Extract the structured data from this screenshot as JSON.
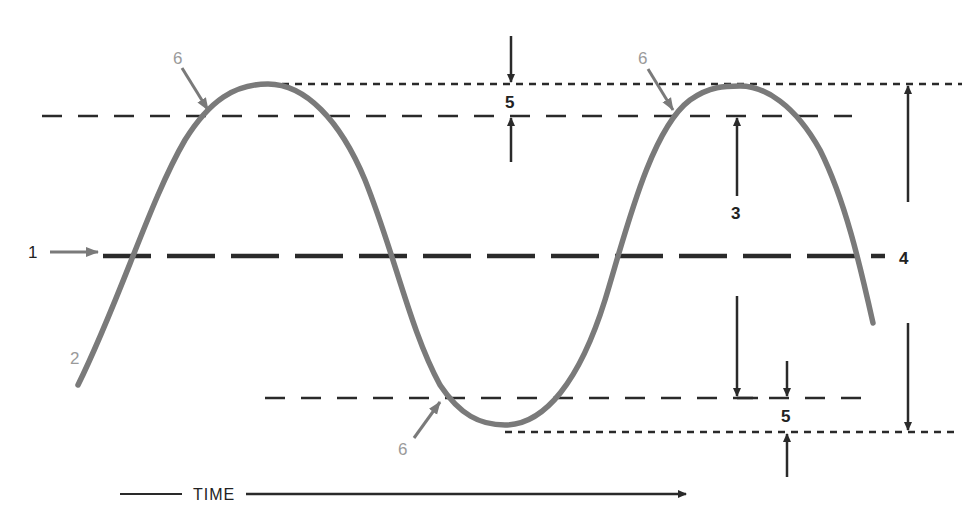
{
  "diagram": {
    "colors": {
      "wave": "#7a7a7a",
      "dark_line": "#2a2a2a",
      "gray_label": "#9a9a9a",
      "background": "#ffffff"
    },
    "labels": {
      "reference_line": "1",
      "waveform": "2",
      "amplitude": "3",
      "peak_to_peak": "4",
      "tolerance_top": "5",
      "tolerance_bottom": "5",
      "crossing_1": "6",
      "crossing_2": "6",
      "crossing_3": "6",
      "time_axis": "TIME"
    },
    "lines": {
      "peak_line_y": 84,
      "upper_level_y": 116,
      "center_line_y": 256,
      "lower_level_y": 398,
      "trough_line_y": 432
    },
    "callouts": [
      {
        "id": "1",
        "x": 30,
        "y": 256,
        "meaning": "center reference line"
      },
      {
        "id": "2",
        "x": 75,
        "y": 360,
        "meaning": "waveform"
      },
      {
        "id": "3",
        "x": 737,
        "y": 216,
        "meaning": "amplitude"
      },
      {
        "id": "4",
        "x": 905,
        "y": 260,
        "meaning": "peak-to-peak"
      },
      {
        "id": "5",
        "x": 511,
        "y": 103,
        "meaning": "top tolerance band"
      },
      {
        "id": "5",
        "x": 786,
        "y": 416,
        "meaning": "bottom tolerance band"
      },
      {
        "id": "6",
        "x": 178,
        "y": 62,
        "meaning": "crossing point"
      },
      {
        "id": "6",
        "x": 640,
        "y": 62,
        "meaning": "crossing point"
      },
      {
        "id": "6",
        "x": 403,
        "y": 455,
        "meaning": "crossing point"
      }
    ]
  }
}
